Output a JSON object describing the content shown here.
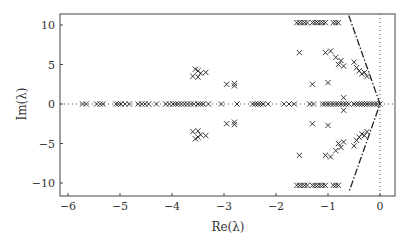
{
  "chart_data": {
    "type": "scatter",
    "title": "",
    "xlabel": "Re(λ)",
    "ylabel": "Im(λ)",
    "xlim": [
      -6.2,
      0.3
    ],
    "ylim": [
      -11.2,
      11.2
    ],
    "xticks": [
      -6,
      -5,
      -4,
      -3,
      -2,
      -1,
      0
    ],
    "yticks": [
      -10,
      -5,
      0,
      5,
      10
    ],
    "grid": false,
    "marker": "x",
    "series": [
      {
        "name": "eigenvalues",
        "points": [
          [
            -5.72,
            0
          ],
          [
            -5.65,
            0
          ],
          [
            -5.45,
            0
          ],
          [
            -5.38,
            0
          ],
          [
            -5.33,
            0
          ],
          [
            -5.08,
            0
          ],
          [
            -5.03,
            0
          ],
          [
            -4.98,
            0
          ],
          [
            -4.9,
            0
          ],
          [
            -4.82,
            0
          ],
          [
            -4.65,
            0
          ],
          [
            -4.58,
            0
          ],
          [
            -4.52,
            0
          ],
          [
            -4.45,
            0
          ],
          [
            -4.3,
            0
          ],
          [
            -4.12,
            0
          ],
          [
            -4.05,
            0
          ],
          [
            -3.98,
            0
          ],
          [
            -3.93,
            0
          ],
          [
            -3.88,
            0
          ],
          [
            -3.82,
            0
          ],
          [
            -3.76,
            0
          ],
          [
            -3.7,
            0
          ],
          [
            -3.64,
            0
          ],
          [
            -3.58,
            0
          ],
          [
            -3.5,
            0
          ],
          [
            -3.45,
            0
          ],
          [
            -3.4,
            0
          ],
          [
            -3.3,
            0
          ],
          [
            -3.05,
            0
          ],
          [
            -2.75,
            0
          ],
          [
            -2.45,
            0
          ],
          [
            -2.4,
            0
          ],
          [
            -2.35,
            0
          ],
          [
            -2.3,
            0
          ],
          [
            -2.25,
            0
          ],
          [
            -2.15,
            0
          ],
          [
            -1.85,
            0
          ],
          [
            -1.75,
            0
          ],
          [
            -1.65,
            0
          ],
          [
            -1.35,
            0
          ],
          [
            -1.28,
            0
          ],
          [
            -1.1,
            0
          ],
          [
            -1.05,
            0
          ],
          [
            -1.0,
            0
          ],
          [
            -0.95,
            0
          ],
          [
            -0.9,
            0
          ],
          [
            -0.85,
            0
          ],
          [
            -0.8,
            0
          ],
          [
            -0.75,
            0
          ],
          [
            -0.7,
            0
          ],
          [
            -0.65,
            0
          ],
          [
            -0.6,
            0
          ],
          [
            -0.5,
            0
          ],
          [
            -0.45,
            0
          ],
          [
            -0.4,
            0
          ],
          [
            -0.35,
            0
          ],
          [
            -0.3,
            0
          ],
          [
            -0.25,
            0
          ],
          [
            -0.2,
            0
          ],
          [
            -0.15,
            0
          ],
          [
            -0.1,
            0
          ],
          [
            -0.05,
            0
          ],
          [
            0,
            0
          ],
          [
            -3.55,
            4.4
          ],
          [
            -3.5,
            4.2
          ],
          [
            -3.45,
            3.9
          ],
          [
            -3.35,
            4.0
          ],
          [
            -3.6,
            3.5
          ],
          [
            -3.5,
            3.4
          ],
          [
            -2.95,
            2.5
          ],
          [
            -2.8,
            2.6
          ],
          [
            -2.8,
            2.3
          ],
          [
            -3.55,
            -4.4
          ],
          [
            -3.5,
            -4.2
          ],
          [
            -3.45,
            -3.9
          ],
          [
            -3.35,
            -4.0
          ],
          [
            -3.6,
            -3.5
          ],
          [
            -3.5,
            -3.4
          ],
          [
            -2.95,
            -2.5
          ],
          [
            -2.8,
            -2.6
          ],
          [
            -2.8,
            -2.3
          ],
          [
            -1.6,
            10.3
          ],
          [
            -1.55,
            10.3
          ],
          [
            -1.5,
            10.3
          ],
          [
            -1.45,
            10.3
          ],
          [
            -1.4,
            10.3
          ],
          [
            -1.3,
            10.3
          ],
          [
            -1.25,
            10.3
          ],
          [
            -1.2,
            10.3
          ],
          [
            -1.15,
            10.3
          ],
          [
            -1.1,
            10.3
          ],
          [
            -1.05,
            10.3
          ],
          [
            -0.9,
            10.3
          ],
          [
            -0.85,
            10.3
          ],
          [
            -0.8,
            10.3
          ],
          [
            -1.6,
            -10.3
          ],
          [
            -1.55,
            -10.3
          ],
          [
            -1.5,
            -10.3
          ],
          [
            -1.45,
            -10.3
          ],
          [
            -1.4,
            -10.3
          ],
          [
            -1.3,
            -10.3
          ],
          [
            -1.25,
            -10.3
          ],
          [
            -1.2,
            -10.3
          ],
          [
            -1.15,
            -10.3
          ],
          [
            -1.1,
            -10.3
          ],
          [
            -1.05,
            -10.3
          ],
          [
            -0.9,
            -10.3
          ],
          [
            -0.85,
            -10.3
          ],
          [
            -0.8,
            -10.3
          ],
          [
            -1.55,
            6.5
          ],
          [
            -1.05,
            6.5
          ],
          [
            -0.95,
            6.7
          ],
          [
            -0.85,
            5.9
          ],
          [
            -0.75,
            5.5
          ],
          [
            -0.8,
            5.0
          ],
          [
            -0.7,
            4.8
          ],
          [
            -0.5,
            5.3
          ],
          [
            -0.45,
            4.6
          ],
          [
            -0.4,
            4.2
          ],
          [
            -0.35,
            3.8
          ],
          [
            -0.3,
            4.0
          ],
          [
            -0.25,
            3.5
          ],
          [
            -1.3,
            2.5
          ],
          [
            -1.0,
            2.7
          ],
          [
            -0.7,
            0.8
          ],
          [
            -1.55,
            -6.5
          ],
          [
            -1.05,
            -6.5
          ],
          [
            -0.95,
            -6.7
          ],
          [
            -0.85,
            -5.9
          ],
          [
            -0.75,
            -5.5
          ],
          [
            -0.8,
            -5.0
          ],
          [
            -0.7,
            -4.8
          ],
          [
            -0.5,
            -5.3
          ],
          [
            -0.45,
            -4.6
          ],
          [
            -0.4,
            -4.2
          ],
          [
            -0.35,
            -3.8
          ],
          [
            -0.3,
            -4.0
          ],
          [
            -0.25,
            -3.5
          ],
          [
            -1.3,
            -2.5
          ],
          [
            -1.0,
            -2.7
          ],
          [
            -0.7,
            -0.8
          ]
        ]
      }
    ],
    "annotations": [
      {
        "type": "dashdot-line",
        "points": [
          [
            -0.6,
            11.2
          ],
          [
            0,
            0
          ],
          [
            -0.6,
            -11.2
          ]
        ]
      },
      {
        "type": "dotted-vline",
        "x": 0
      },
      {
        "type": "dotted-hline",
        "y": 0
      }
    ]
  }
}
